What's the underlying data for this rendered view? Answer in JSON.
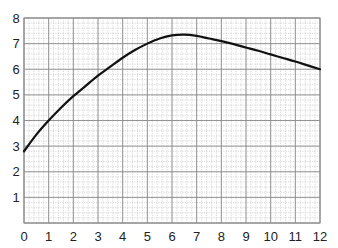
{
  "chart_data": {
    "type": "line",
    "title": "",
    "xlabel": "",
    "ylabel": "",
    "xlim": [
      0,
      12
    ],
    "ylim": [
      0,
      8
    ],
    "x_ticks": [
      0,
      1,
      2,
      3,
      4,
      5,
      6,
      7,
      8,
      9,
      10,
      11,
      12
    ],
    "y_ticks": [
      1,
      2,
      3,
      4,
      5,
      6,
      7,
      8
    ],
    "grid": {
      "major": true,
      "minor": true,
      "minor_divisions": 5
    },
    "legend": null,
    "series": [
      {
        "name": "curve",
        "color": "#111111",
        "x": [
          0,
          0.5,
          1,
          1.5,
          2,
          2.5,
          3,
          3.5,
          4,
          4.5,
          5,
          5.5,
          6,
          6.5,
          7,
          7.5,
          8,
          8.5,
          9,
          9.5,
          10,
          10.5,
          11,
          11.5,
          12
        ],
        "values": [
          2.8,
          3.45,
          4.0,
          4.5,
          4.95,
          5.35,
          5.75,
          6.1,
          6.45,
          6.75,
          7.0,
          7.2,
          7.32,
          7.35,
          7.3,
          7.2,
          7.1,
          6.98,
          6.85,
          6.72,
          6.58,
          6.44,
          6.3,
          6.15,
          6.0
        ]
      }
    ]
  }
}
